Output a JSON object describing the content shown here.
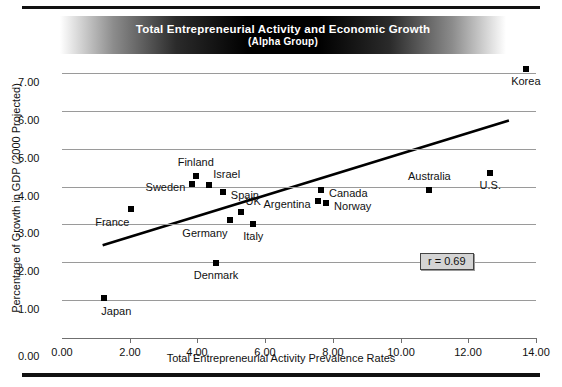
{
  "title": {
    "line1": "Total Entrepreneurial Activity and Economic Growth",
    "line2": "(Alpha Group)"
  },
  "annotation": {
    "correlation_label": "r = 0.69"
  },
  "chart_data": {
    "type": "scatter",
    "title": "Total Entrepreneurial Activity and Economic Growth (Alpha Group)",
    "subtitle": "(Alpha Group)",
    "xlabel": "Total Entrepreneurial Activity Prevalence Rates",
    "ylabel": "Percentage of Growth in GDP (2000 Projected)",
    "xlim": [
      0.0,
      14.0
    ],
    "ylim": [
      0.0,
      7.4
    ],
    "xticks": [
      "0.00",
      "2.00",
      "4.00",
      "6.00",
      "8.00",
      "10.00",
      "12.00",
      "14.00"
    ],
    "xtick_values": [
      0,
      2,
      4,
      6,
      8,
      10,
      12,
      14
    ],
    "yticks": [
      "1.00",
      "2.00",
      "3.00",
      "4.00",
      "5.00",
      "6.00",
      "7.00"
    ],
    "ytick_values": [
      1,
      2,
      3,
      4,
      5,
      6,
      7
    ],
    "grid": "horizontal",
    "legend": "none",
    "annotations": [
      {
        "text": "r = 0.69",
        "x": 11.4,
        "y": 2.0
      }
    ],
    "trendline": {
      "type": "linear",
      "x": [
        1.2,
        13.2
      ],
      "y": [
        2.45,
        5.75
      ]
    },
    "points": [
      {
        "label": "Japan",
        "x": 1.25,
        "y": 1.05,
        "label_pos": "below-right"
      },
      {
        "label": "France",
        "x": 2.05,
        "y": 3.42,
        "label_pos": "below-left"
      },
      {
        "label": "Sweden",
        "x": 3.85,
        "y": 4.08,
        "label_pos": "left"
      },
      {
        "label": "Finland",
        "x": 3.95,
        "y": 4.28,
        "label_pos": "above"
      },
      {
        "label": "Israel",
        "x": 4.35,
        "y": 4.05,
        "label_pos": "above-right"
      },
      {
        "label": "Denmark",
        "x": 4.55,
        "y": 1.98,
        "label_pos": "below"
      },
      {
        "label": "Spain",
        "x": 4.75,
        "y": 3.85,
        "label_pos": "right"
      },
      {
        "label": "Germany",
        "x": 4.95,
        "y": 3.12,
        "label_pos": "below-left"
      },
      {
        "label": "UK",
        "x": 5.3,
        "y": 3.32,
        "label_pos": "above-right"
      },
      {
        "label": "Italy",
        "x": 5.65,
        "y": 3.02,
        "label_pos": "below"
      },
      {
        "label": "Argentina",
        "x": 7.55,
        "y": 3.62,
        "label_pos": "left"
      },
      {
        "label": "Canada",
        "x": 7.65,
        "y": 3.9,
        "label_pos": "right"
      },
      {
        "label": "Norway",
        "x": 7.8,
        "y": 3.58,
        "label_pos": "right"
      },
      {
        "label": "Australia",
        "x": 10.85,
        "y": 3.92,
        "label_pos": "above"
      },
      {
        "label": "U.S.",
        "x": 12.65,
        "y": 4.35,
        "label_pos": "below"
      },
      {
        "label": "Korea",
        "x": 13.7,
        "y": 7.12,
        "label_pos": "below"
      }
    ]
  }
}
